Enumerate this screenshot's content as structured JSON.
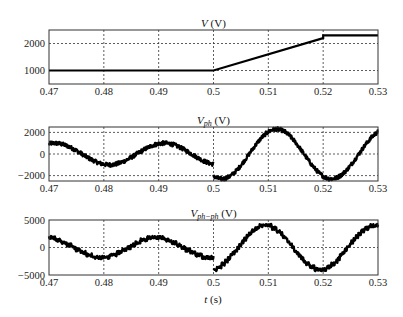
{
  "chart_data": [
    {
      "type": "line",
      "title": "V (V)",
      "title_var": "V",
      "title_sub": "",
      "title_unit": " (V)",
      "xlabel": "",
      "ylabel": "",
      "xlim": [
        0.47,
        0.53
      ],
      "ylim": [
        500,
        2500
      ],
      "xticks": [
        0.47,
        0.48,
        0.49,
        0.5,
        0.51,
        0.52,
        0.53
      ],
      "xtick_labels": [
        "0.47",
        "0.48",
        "0.49",
        "0.5",
        "0.51",
        "0.52",
        "0.53"
      ],
      "yticks": [
        1000,
        2000
      ],
      "ytick_labels": [
        "1000",
        "2000"
      ],
      "grid": true,
      "series": [
        {
          "name": "V",
          "x": [
            0.47,
            0.5,
            0.52,
            0.52,
            0.53
          ],
          "y": [
            1000,
            1000,
            2200,
            2300,
            2300
          ]
        }
      ]
    },
    {
      "type": "line",
      "title": "Vph (V)",
      "title_var": "V",
      "title_sub": "ph",
      "title_unit": " (V)",
      "xlabel": "",
      "ylabel": "",
      "xlim": [
        0.47,
        0.53
      ],
      "ylim": [
        -2500,
        2500
      ],
      "xticks": [
        0.47,
        0.48,
        0.49,
        0.5,
        0.51,
        0.52,
        0.53
      ],
      "xtick_labels": [
        "0.47",
        "0.48",
        "0.49",
        "0.5",
        "0.51",
        "0.52",
        "0.53"
      ],
      "yticks": [
        -2000,
        0,
        2000
      ],
      "ytick_labels": [
        "−2000",
        "0",
        "2000"
      ],
      "grid": true,
      "series": [
        {
          "name": "Vph",
          "description": "noisy sinusoid, 50 Hz; amplitude ~1000 V before t=0.5 s, ~2300 V after; peaks ~0.491 and ~0.511, troughs ~0.481 and ~0.521; step down at t=0.5 s",
          "segments": [
            {
              "t_start": 0.47,
              "t_end": 0.5,
              "amplitude": 1000,
              "freq": 50,
              "phase_peak": 0.491,
              "noise": 180
            },
            {
              "t_start": 0.5,
              "t_end": 0.53,
              "amplitude": 2300,
              "freq": 50,
              "phase_peak": 0.5115,
              "noise": 180
            }
          ]
        }
      ]
    },
    {
      "type": "line",
      "title": "Vph-ph (V)",
      "title_var": "V",
      "title_sub": "ph−ph",
      "title_unit": " (V)",
      "xlabel": "t (s)",
      "ylabel": "",
      "xlim": [
        0.47,
        0.53
      ],
      "ylim": [
        -5000,
        5000
      ],
      "xticks": [
        0.47,
        0.48,
        0.49,
        0.5,
        0.51,
        0.52,
        0.53
      ],
      "xtick_labels": [
        "0.47",
        "0.48",
        "0.49",
        "0.5",
        "0.51",
        "0.52",
        "0.53"
      ],
      "yticks": [
        -5000,
        0,
        5000
      ],
      "ytick_labels": [
        "−5000",
        "0",
        "5000"
      ],
      "grid": true,
      "series": [
        {
          "name": "Vph-ph",
          "description": "stepped (multilevel) sinusoid, 50 Hz; amplitude ~1800 V before t=0.5 s, ~4000 V after; peaks ~0.4895 and ~0.5095, troughs ~0.4795 and ~0.5195",
          "segments": [
            {
              "t_start": 0.47,
              "t_end": 0.5,
              "amplitude": 1800,
              "freq": 50,
              "phase_peak": 0.4895,
              "levels": 4,
              "noise": 300
            },
            {
              "t_start": 0.5,
              "t_end": 0.53,
              "amplitude": 4000,
              "freq": 50,
              "phase_peak": 0.5095,
              "levels": 8,
              "noise": 300
            }
          ]
        }
      ]
    }
  ],
  "figure": {
    "xlabel": "t (s)",
    "line_color": "#000000",
    "grid_color": "#333333",
    "frame_color": "#333333"
  }
}
